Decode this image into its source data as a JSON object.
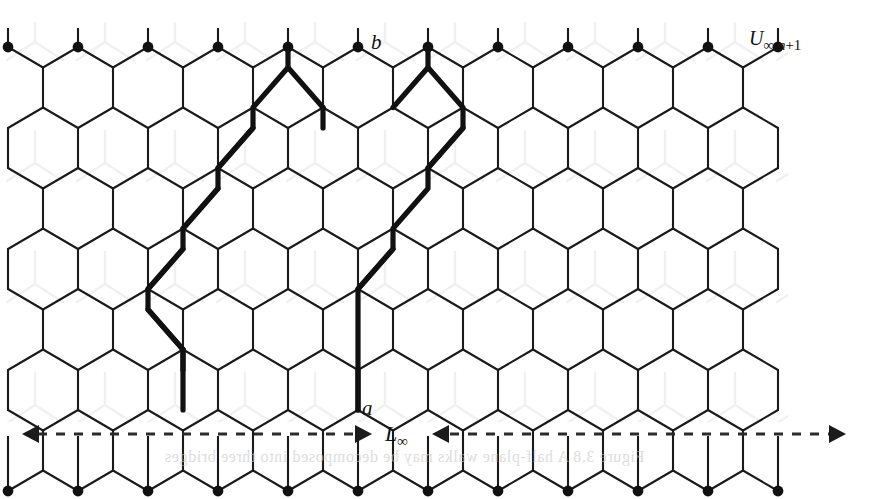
{
  "figure": {
    "type": "hexagonal-lattice-diagram",
    "labels": {
      "vertex_top": "b",
      "vertex_bottom": "a",
      "width_marker": "L",
      "width_marker_sub": "∞",
      "region": "U",
      "region_sub_1": "∞,",
      "region_sub_2": "n",
      "region_sub_3": "+1"
    },
    "bleed_through_text": "Figure 3.8   A half-plane walks  may be decomposed into three bridges",
    "colors": {
      "background": "#ffffff",
      "lattice_line": "#1a1a1a",
      "bold_path": "#111111",
      "dot": "#111111",
      "dashed_arrow": "#2b2b2b",
      "ghost_pattern": "#efefef",
      "bleed_text": "#c9c9c9"
    },
    "geometry": {
      "lattice_left": 8,
      "lattice_right": 782,
      "col_pitch": 70,
      "row_pitch": 121,
      "hex_half_width": 35,
      "hex_side": 40,
      "top_dot_y": 47,
      "bottom_dot_y": 412,
      "stem_top_y": 28,
      "stem_bottom_y": 436,
      "dot_radius": 5.4,
      "line_width": 2.1,
      "bold_width": 5.2
    },
    "width_arrow": {
      "y": 434,
      "left_x": 22,
      "right_x": 846,
      "gap_left": 372,
      "gap_right": 432,
      "dash": "9 9"
    }
  }
}
